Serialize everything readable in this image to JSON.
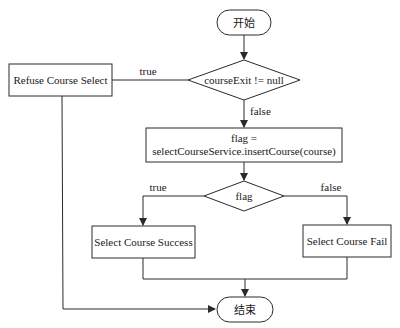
{
  "diagram": {
    "type": "flowchart",
    "nodes": {
      "start": {
        "label": "开始",
        "shape": "terminator"
      },
      "decision1": {
        "label": "courseExit != null",
        "shape": "decision"
      },
      "refuse": {
        "label": "Refuse Course Select",
        "shape": "process"
      },
      "insert": {
        "line1": "flag =",
        "line2": "selectCourseService.insertCourse(course)",
        "shape": "process"
      },
      "decision2": {
        "label": "flag",
        "shape": "decision"
      },
      "success": {
        "label": "Select Course Success",
        "shape": "process"
      },
      "fail": {
        "label": "Select Course Fail",
        "shape": "process"
      },
      "end": {
        "label": "结束",
        "shape": "terminator"
      }
    },
    "edges": {
      "d1_true": "true",
      "d1_false": "false",
      "d2_true": "true",
      "d2_false": "false"
    }
  }
}
